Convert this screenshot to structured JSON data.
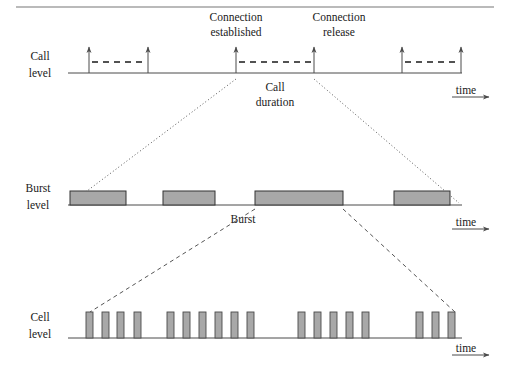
{
  "figure": {
    "title_rule_visible": true,
    "background_color": "#ffffff",
    "ink_color": "#1a1a1a",
    "fill_color": "#a8a8a8"
  },
  "annotations": {
    "connection_established": "Connection\nestablished",
    "connection_established_line1": "Connection",
    "connection_established_line2": "established",
    "connection_release_line1": "Connection",
    "connection_release_line2": "release",
    "call_duration_line1": "Call",
    "call_duration_line2": "duration",
    "burst_label": "Burst"
  },
  "levels": [
    {
      "id": "call-level",
      "label_line1": "Call",
      "label_line2": "level",
      "axis_label": "time",
      "baseline_y": 73,
      "axis_x_start": 68,
      "axis_x_end": 462,
      "events_x": [
        89,
        148,
        236,
        314,
        402,
        461
      ],
      "arrow_height": 26,
      "active_spans": [
        {
          "from_x": 89,
          "to_x": 148
        },
        {
          "from_x": 236,
          "to_x": 314
        },
        {
          "from_x": 402,
          "to_x": 461
        }
      ],
      "span_y": 62
    },
    {
      "id": "burst-level",
      "label_line1": "Burst",
      "label_line2": "level",
      "axis_label": "time",
      "baseline_y": 205,
      "axis_x_start": 68,
      "axis_x_end": 462,
      "bursts": [
        {
          "x": 70,
          "width": 56
        },
        {
          "x": 163,
          "width": 52
        },
        {
          "x": 255,
          "width": 88
        },
        {
          "x": 394,
          "width": 56
        }
      ],
      "burst_height": 14
    },
    {
      "id": "cell-level",
      "label_line1": "Cell",
      "label_line2": "level",
      "axis_label": "time",
      "baseline_y": 338,
      "axis_x_start": 68,
      "axis_x_end": 462,
      "cells_x": [
        89,
        105,
        120,
        137,
        170,
        186,
        202,
        218,
        234,
        250,
        301,
        317,
        333,
        349,
        365,
        419,
        435,
        451
      ],
      "cell_width": 7,
      "cell_height": 26
    }
  ],
  "connectors": [
    {
      "id": "call-to-burst-left",
      "style": "dotted",
      "from_x": 236,
      "from_y": 78,
      "to_x": 70,
      "to_y": 204
    },
    {
      "id": "call-to-burst-right",
      "style": "dotted",
      "from_x": 314,
      "from_y": 78,
      "to_x": 460,
      "to_y": 204
    },
    {
      "id": "burst-to-cell-left",
      "style": "dashed",
      "from_x": 255,
      "from_y": 210,
      "to_x": 89,
      "to_y": 312
    },
    {
      "id": "burst-to-cell-right",
      "style": "dashed",
      "from_x": 343,
      "from_y": 210,
      "to_x": 455,
      "to_y": 312
    }
  ]
}
